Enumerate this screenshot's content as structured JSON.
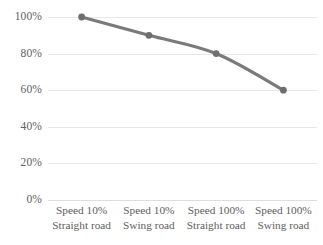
{
  "chart_data": {
    "type": "line",
    "title": "",
    "subtitle": "",
    "xlabel": "",
    "ylabel": "",
    "categories": [
      "Speed 10% Straight road",
      "Speed 10% Swing road",
      "Speed 100% Straight road",
      "Speed 100% Swing road"
    ],
    "category_lines": [
      {
        "line1": "Speed 10%",
        "line2": "Straight road"
      },
      {
        "line1": "Speed 10%",
        "line2": "Swing road"
      },
      {
        "line1": "Speed 100%",
        "line2": "Straight road"
      },
      {
        "line1": "Speed 100%",
        "line2": "Swing road"
      }
    ],
    "values": [
      100,
      90,
      80,
      60
    ],
    "value_labels": [
      "100%",
      "90%",
      "80%",
      "60%"
    ],
    "ylim": [
      0,
      100
    ],
    "ytick_values": [
      100,
      80,
      60,
      40,
      20,
      0
    ],
    "ytick_labels": [
      "100%",
      "80%",
      "60%",
      "40%",
      "20%",
      "0%"
    ],
    "grid": true,
    "legend": false,
    "legend_position": "none",
    "series": [
      {
        "name": "",
        "values": [
          100,
          90,
          80,
          60
        ],
        "line_color": "#7a7a7a",
        "marker_color": "#6e6e6e",
        "marker": "circle",
        "smooth": true
      }
    ],
    "colors": {
      "line": "#7a7a7a",
      "marker": "#6e6e6e",
      "gridline": "#e8e8e8",
      "axis": "#dedede",
      "text": "#5e5e5e",
      "background": "#ffffff"
    }
  }
}
